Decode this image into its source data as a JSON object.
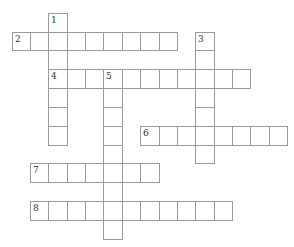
{
  "puzzle": {
    "type": "crossword",
    "grid": {
      "origin_x": 11.7,
      "origin_y": 12.7,
      "cell_width": 18.35,
      "cell_height": 18.83,
      "border_color": "#9a9a9a",
      "cell_fill": "#ffffff",
      "number_color": "#333333"
    },
    "entries": [
      {
        "number": "1",
        "direction": "down",
        "row": 0,
        "col": 2,
        "length": 7
      },
      {
        "number": "2",
        "direction": "across",
        "row": 1,
        "col": 0,
        "length": 9
      },
      {
        "number": "3",
        "direction": "down",
        "row": 1,
        "col": 10,
        "length": 7
      },
      {
        "number": "4",
        "direction": "across",
        "row": 3,
        "col": 2,
        "length": 11
      },
      {
        "number": "5",
        "direction": "down",
        "row": 3,
        "col": 5,
        "length": 9
      },
      {
        "number": "6",
        "direction": "across",
        "row": 6,
        "col": 7,
        "length": 8
      },
      {
        "number": "7",
        "direction": "across",
        "row": 8,
        "col": 1,
        "length": 7
      },
      {
        "number": "8",
        "direction": "across",
        "row": 10,
        "col": 1,
        "length": 11
      }
    ]
  }
}
